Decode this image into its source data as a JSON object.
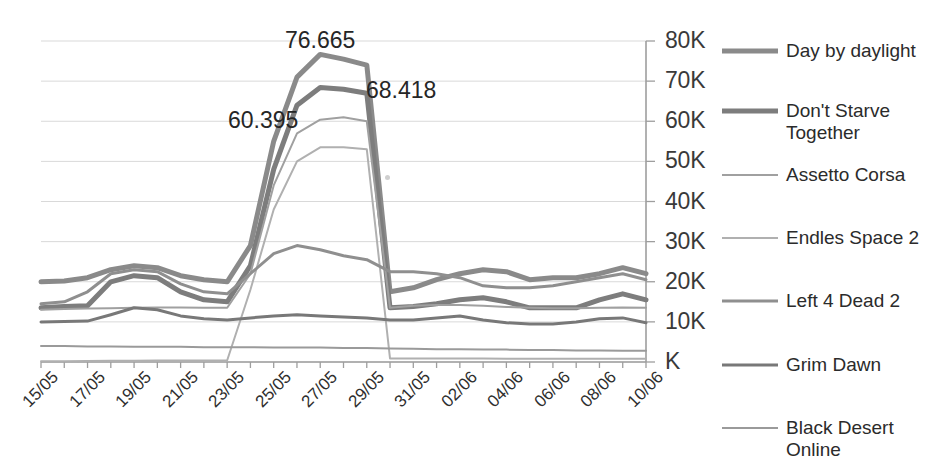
{
  "chart_data": {
    "type": "line",
    "title": "",
    "xlabel": "",
    "ylabel": "",
    "ylim": [
      0,
      80000
    ],
    "grid": true,
    "legend_position": "right",
    "y_ticks": [
      "K",
      "10K",
      "20K",
      "30K",
      "40K",
      "50K",
      "60K",
      "70K",
      "80K"
    ],
    "y_tick_values": [
      0,
      10000,
      20000,
      30000,
      40000,
      50000,
      60000,
      70000,
      80000
    ],
    "x_tick_labels": [
      "15/05",
      "17/05",
      "19/05",
      "21/05",
      "23/05",
      "25/05",
      "27/05",
      "29/05",
      "31/05",
      "02/06",
      "04/06",
      "06/06",
      "08/06",
      "10/06"
    ],
    "x": [
      "15/05",
      "16/05",
      "17/05",
      "18/05",
      "19/05",
      "20/05",
      "21/05",
      "22/05",
      "23/05",
      "24/05",
      "25/05",
      "26/05",
      "27/05",
      "28/05",
      "29/05",
      "30/05",
      "31/05",
      "01/06",
      "02/06",
      "03/06",
      "04/06",
      "05/06",
      "06/06",
      "07/06",
      "08/06",
      "09/06",
      "10/06"
    ],
    "annotations": [
      {
        "text": "76.665",
        "value": 76665,
        "series": "Day by daylight",
        "x": "27/05"
      },
      {
        "text": "68.418",
        "value": 68418,
        "series": "Don't Starve Together",
        "x": "28/05"
      },
      {
        "text": "60.395",
        "value": 60395,
        "series": "Assetto Corsa",
        "x": "26/05"
      }
    ],
    "series": [
      {
        "name": "Day by daylight",
        "color": "#8a8a8a",
        "width": 5,
        "values": [
          20000,
          20200,
          21000,
          23000,
          24000,
          23500,
          21500,
          20500,
          20000,
          29000,
          55000,
          71000,
          76665,
          75500,
          74000,
          17500,
          18500,
          20500,
          22000,
          23000,
          22500,
          20500,
          21000,
          21000,
          22000,
          23500,
          22000
        ]
      },
      {
        "name": "Don't Starve Together",
        "color": "#7d7d7d",
        "width": 5,
        "values": [
          13500,
          13800,
          14000,
          20000,
          21500,
          21000,
          17500,
          15500,
          15000,
          24000,
          48000,
          64000,
          68418,
          68000,
          67000,
          13500,
          13800,
          14500,
          15500,
          16000,
          15000,
          13500,
          13500,
          13500,
          15500,
          17000,
          15500
        ]
      },
      {
        "name": "Assetto Corsa",
        "color": "#a0a0a0",
        "width": 2,
        "values": [
          13000,
          13200,
          13300,
          13400,
          13500,
          13600,
          13600,
          13500,
          13500,
          22000,
          44000,
          57000,
          60395,
          61000,
          60000,
          13500,
          14000,
          14200,
          14200,
          14000,
          13700,
          13500,
          13400,
          13400,
          13500,
          13600,
          13500
        ]
      },
      {
        "name": "Endles Space 2",
        "color": "#b0b0b0",
        "width": 2,
        "values": [
          200,
          200,
          250,
          300,
          300,
          350,
          400,
          400,
          450,
          18000,
          38000,
          50000,
          53500,
          53500,
          53000,
          900,
          900,
          900,
          900,
          850,
          800,
          800,
          800,
          800,
          800,
          800,
          800
        ]
      },
      {
        "name": "Left 4 Dead 2",
        "color": "#8f8f8f",
        "width": 3,
        "values": [
          14500,
          15000,
          17500,
          22000,
          23000,
          22500,
          19500,
          17500,
          17000,
          22000,
          27000,
          29000,
          28000,
          26500,
          25500,
          22500,
          22500,
          22000,
          21000,
          19000,
          18500,
          18500,
          19000,
          20000,
          21000,
          22000,
          20500
        ]
      },
      {
        "name": "Grim Dawn",
        "color": "#787878",
        "width": 3,
        "values": [
          10000,
          10100,
          10200,
          11800,
          13500,
          13000,
          11500,
          10800,
          10500,
          11000,
          11500,
          11800,
          11500,
          11200,
          11000,
          10500,
          10500,
          11000,
          11500,
          10500,
          9800,
          9500,
          9500,
          10000,
          10800,
          11000,
          9800
        ]
      },
      {
        "name": "Black Desert Online",
        "color": "#9a9a9a",
        "width": 2,
        "values": [
          4000,
          4000,
          3900,
          3900,
          3800,
          3800,
          3800,
          3700,
          3700,
          3700,
          3600,
          3600,
          3600,
          3500,
          3500,
          3400,
          3300,
          3200,
          3200,
          3100,
          3100,
          3000,
          3000,
          2900,
          2900,
          2800,
          2800
        ]
      }
    ]
  },
  "legend": {
    "items": [
      {
        "label": "Day by daylight"
      },
      {
        "label": "Don't Starve Together"
      },
      {
        "label": "Assetto Corsa"
      },
      {
        "label": "Endles Space 2"
      },
      {
        "label": "Left 4 Dead 2"
      },
      {
        "label": "Grim Dawn"
      },
      {
        "label": "Black Desert Online"
      }
    ]
  },
  "colors": {
    "background": "#ffffff",
    "grid": "#d9d9d9",
    "axis": "#9e9e9e",
    "text": "#2b2b2b"
  }
}
